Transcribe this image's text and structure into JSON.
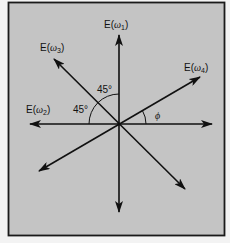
{
  "diagram": {
    "type": "vector-diagram",
    "colors": {
      "panel_background": "#c4c4c4",
      "page_background": "#f3f3f3",
      "stroke": "#111111",
      "frame": "#1a1a1a"
    },
    "labels": {
      "e1": {
        "prefix": "E(",
        "symbol": "ω",
        "subscript": "1",
        "suffix": ")"
      },
      "e2": {
        "prefix": "E(",
        "symbol": "ω",
        "subscript": "2",
        "suffix": ")"
      },
      "e3": {
        "prefix": "E(",
        "symbol": "ω",
        "subscript": "3",
        "suffix": ")"
      },
      "e4": {
        "prefix": "E(",
        "symbol": "ω",
        "subscript": "4",
        "suffix": ")"
      }
    },
    "angles": {
      "upper": "45°",
      "left": "45°",
      "phi": "ϕ"
    },
    "vectors": [
      {
        "name": "E(ω1)",
        "axis": "vertical",
        "angle_deg": 90,
        "bidirectional": true
      },
      {
        "name": "E(ω2)",
        "axis": "horizontal",
        "angle_deg": 180,
        "bidirectional": true
      },
      {
        "name": "E(ω3)",
        "axis": "diagonal",
        "angle_deg": 135,
        "bidirectional": true
      },
      {
        "name": "E(ω4)",
        "axis": "oblique",
        "angle_deg": 30,
        "angle_label": "ϕ",
        "bidirectional": true
      }
    ]
  }
}
